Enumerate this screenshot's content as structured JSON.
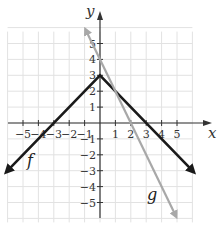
{
  "chart_data": {
    "type": "line",
    "title": "",
    "xlabel": "x",
    "ylabel": "y",
    "xlim": [
      -6,
      6
    ],
    "ylim": [
      -6,
      6
    ],
    "grid": true,
    "x_ticks": [
      -5,
      -4,
      -3,
      -2,
      -1,
      1,
      2,
      3,
      4,
      5
    ],
    "y_ticks": [
      -5,
      -4,
      -3,
      -2,
      -1,
      1,
      2,
      3,
      4,
      5
    ],
    "x_tick_labels": [
      "−5",
      "−4",
      "−3",
      "−2",
      "−1",
      "1",
      "2",
      "3",
      "4",
      "5"
    ],
    "y_tick_labels": [
      "−5",
      "−4",
      "−3",
      "−2",
      "−1",
      "1",
      "2",
      "3",
      "4",
      "5"
    ],
    "series": [
      {
        "name": "f",
        "color": "#1a1a1a",
        "formula": "f(x) = 3 - |x|",
        "points": [
          [
            -6,
            -3
          ],
          [
            0,
            3
          ],
          [
            6,
            -3
          ]
        ],
        "label_pos": [
          -5.0,
          -2.2
        ]
      },
      {
        "name": "g",
        "color": "#a8a8a8",
        "formula": "g(x) = -2x + 4",
        "points": [
          [
            -0.9,
            5.8
          ],
          [
            4.9,
            -5.8
          ]
        ],
        "label_pos": [
          3.4,
          -4.6
        ]
      }
    ]
  },
  "labels": {
    "x_axis": "x",
    "y_axis": "y",
    "f": "f",
    "g": "g"
  }
}
